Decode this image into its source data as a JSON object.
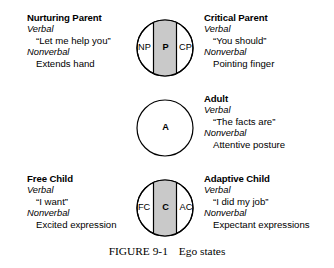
{
  "figure": {
    "caption_label": "FIGURE 9-1",
    "caption_title": "Ego states"
  },
  "colors": {
    "band_fill": "#c9c9c9",
    "stroke": "#000000",
    "background": "#ffffff"
  },
  "states": {
    "parent": {
      "circle": {
        "center_letter": "P",
        "left_letter": "NP",
        "right_letter": "CP"
      },
      "left_text": {
        "title": "Nurturing Parent",
        "verbal_label": "Verbal",
        "verbal_value": "“Let me help you”",
        "nonverbal_label": "Nonverbal",
        "nonverbal_value": "Extends hand"
      },
      "right_text": {
        "title": "Critical Parent",
        "verbal_label": "Verbal",
        "verbal_value": "“You should”",
        "nonverbal_label": "Nonverbal",
        "nonverbal_value": "Pointing finger"
      }
    },
    "adult": {
      "circle": {
        "center_letter": "A"
      },
      "right_text": {
        "title": "Adult",
        "verbal_label": "Verbal",
        "verbal_value": "“The facts are”",
        "nonverbal_label": "Nonverbal",
        "nonverbal_value": "Attentive posture"
      }
    },
    "child": {
      "circle": {
        "center_letter": "C",
        "left_letter": "FC",
        "right_letter": "AC"
      },
      "left_text": {
        "title": "Free Child",
        "verbal_label": "Verbal",
        "verbal_value": "“I want”",
        "nonverbal_label": "Nonverbal",
        "nonverbal_value": "Excited expression"
      },
      "right_text": {
        "title": "Adaptive Child",
        "verbal_label": "Verbal",
        "verbal_value": "“I did my job”",
        "nonverbal_label": "Nonverbal",
        "nonverbal_value": "Expectant expressions"
      }
    }
  }
}
